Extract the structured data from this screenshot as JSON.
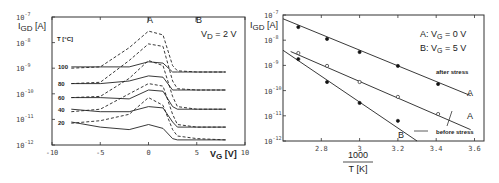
{
  "chart_data": [
    {
      "type": "line",
      "title": "",
      "xlabel": "V_G [V]",
      "ylabel": "I_GD [A]",
      "xlim": [
        -10,
        10
      ],
      "ylim_log10": [
        -12,
        -7
      ],
      "x_ticks": [
        "-10",
        "-5",
        "0",
        "5",
        "10"
      ],
      "y_ticks": [
        "10^-7",
        "10^-8",
        "10^-9",
        "10^-10",
        "10^-11",
        "10^-12"
      ],
      "annotations": [
        "V_D = 2 V",
        "A",
        "B",
        "T [°C]"
      ],
      "legend": {
        "solid": "curve set 1",
        "dashed": "curve set 2"
      },
      "temperature_labels": [
        "100",
        "80",
        "60",
        "40",
        "20"
      ],
      "x": [
        -8,
        -5,
        -2,
        0,
        1.5,
        2.5,
        3,
        5,
        8
      ],
      "series": [
        {
          "name": "T=100 solid",
          "style": "solid",
          "log10_values": [
            -8.95,
            -8.95,
            -8.95,
            -8.75,
            -8.8,
            -9.15,
            -9.15,
            -9.15,
            -9.15
          ]
        },
        {
          "name": "T=100 dashed",
          "style": "dashed",
          "log10_values": [
            -9.0,
            -8.95,
            -8.2,
            -7.55,
            -7.7,
            -8.9,
            -9.1,
            -9.15,
            -9.15
          ]
        },
        {
          "name": "T=80 solid",
          "style": "solid",
          "log10_values": [
            -9.6,
            -9.6,
            -9.5,
            -9.3,
            -9.35,
            -9.85,
            -9.85,
            -9.85,
            -9.85
          ]
        },
        {
          "name": "T=80 dashed",
          "style": "dashed",
          "log10_values": [
            -9.6,
            -9.55,
            -8.7,
            -8.05,
            -8.15,
            -9.5,
            -9.8,
            -9.85,
            -9.85
          ]
        },
        {
          "name": "T=60 solid",
          "style": "solid",
          "log10_values": [
            -10.15,
            -10.15,
            -10.2,
            -9.85,
            -9.9,
            -10.5,
            -10.6,
            -10.6,
            -10.6
          ]
        },
        {
          "name": "T=60 dashed",
          "style": "dashed",
          "log10_values": [
            -10.15,
            -10.1,
            -9.4,
            -8.7,
            -8.9,
            -10.1,
            -10.5,
            -10.6,
            -10.6
          ]
        },
        {
          "name": "T=40 solid",
          "style": "solid",
          "log10_values": [
            -10.6,
            -10.7,
            -10.7,
            -10.5,
            -10.55,
            -11.1,
            -11.3,
            -11.3,
            -11.3
          ]
        },
        {
          "name": "T=40 dashed",
          "style": "dashed",
          "log10_values": [
            -10.7,
            -10.6,
            -10.0,
            -9.6,
            -9.7,
            -10.8,
            -11.2,
            -11.3,
            -11.3
          ]
        },
        {
          "name": "T=20 solid",
          "style": "solid",
          "log10_values": [
            -11.1,
            -11.3,
            -11.4,
            -11.2,
            -11.35,
            -11.75,
            -11.8,
            -11.8,
            -11.8
          ]
        },
        {
          "name": "T=20 dashed",
          "style": "dashed",
          "log10_values": [
            -11.15,
            -11.05,
            -10.8,
            -10.15,
            -10.45,
            -11.4,
            -11.65,
            -11.75,
            -11.8
          ]
        }
      ]
    },
    {
      "type": "scatter",
      "title": "",
      "xlabel": "1000 / T [K]",
      "ylabel": "I_GD [A]",
      "xlim": [
        2.6,
        3.6
      ],
      "ylim_log10": [
        -12,
        -7
      ],
      "x_ticks": [
        "2.8",
        "3",
        "3.2",
        "3.4",
        "3.6"
      ],
      "y_ticks": [
        "10^-7",
        "10^-8",
        "10^-9",
        "10^-10",
        "10^-11",
        "10^-12"
      ],
      "legend": [
        "A: V_G = 0 V",
        "B: V_G = 5 V"
      ],
      "annotations": [
        "after stress",
        "before stress",
        "A",
        "A",
        "B"
      ],
      "series": [
        {
          "name": "A after stress",
          "marker": "filled",
          "x": [
            2.68,
            2.83,
            3.0,
            3.2,
            3.41
          ],
          "log10_values": [
            -7.48,
            -7.95,
            -8.47,
            -9.02,
            -9.74
          ],
          "fit": [
            [
              2.6,
              -7.15
            ],
            [
              3.58,
              -10.2
            ]
          ]
        },
        {
          "name": "A before stress",
          "marker": "open",
          "x": [
            2.68,
            2.83,
            3.0,
            3.2,
            3.41
          ],
          "log10_values": [
            -8.51,
            -9.02,
            -9.66,
            -10.25,
            -10.93
          ],
          "fit": [
            [
              2.64,
              -8.45
            ],
            [
              3.58,
              -11.55
            ]
          ]
        },
        {
          "name": "B before stress",
          "marker": "filled",
          "x": [
            2.68,
            2.83,
            3.0,
            3.2
          ],
          "log10_values": [
            -8.75,
            -9.66,
            -10.49,
            -11.2
          ],
          "fit": [
            [
              2.6,
              -8.4
            ],
            [
              3.3,
              -12.0
            ]
          ]
        }
      ]
    }
  ],
  "left": {
    "ylabel": "I",
    "ylabel_sub": "GD",
    "ylabel_unit": "[A]",
    "xlabel": "V",
    "xlabel_sub": "G",
    "xlabel_unit": "[V]",
    "vd_label": "V",
    "vd_sub": "D",
    "vd_value": "= 2 V",
    "marker_a": "A",
    "marker_b": "B",
    "temp_header": "T [°C]",
    "temps": [
      "100",
      "80",
      "60",
      "40",
      "20"
    ],
    "x_ticks": [
      "-10",
      "-5",
      "0",
      "5",
      "10"
    ],
    "y_exps": [
      "-7",
      "-8",
      "-9",
      "-10",
      "-11",
      "-12"
    ],
    "y_base": "10"
  },
  "right": {
    "ylabel": "I",
    "ylabel_sub": "GD",
    "ylabel_unit": "[A]",
    "legend_a": "A: V",
    "legend_a_sub": "G",
    "legend_a_val": "= 0 V",
    "legend_b": "B: V",
    "legend_b_sub": "G",
    "legend_b_val": "= 5 V",
    "after_stress": "after stress",
    "before_stress": "before stress",
    "label_a1": "A",
    "label_a2": "A",
    "label_b": "B",
    "xlabel_num": "1000",
    "xlabel_den": "T [K]",
    "x_ticks": [
      "2.8",
      "3",
      "3.2",
      "3.4",
      "3.6"
    ],
    "y_exps": [
      "-7",
      "-8",
      "-9",
      "-10",
      "-11",
      "-12"
    ],
    "y_base": "10"
  }
}
